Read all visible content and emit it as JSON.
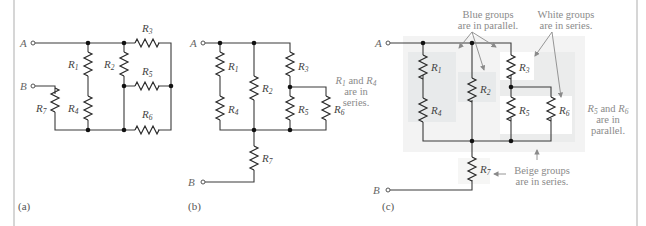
{
  "figure": {
    "panels": [
      {
        "id": "a",
        "caption": "(a)"
      },
      {
        "id": "b",
        "caption": "(b)"
      },
      {
        "id": "c",
        "caption": "(c)"
      }
    ],
    "terminals": {
      "A": "A",
      "B": "B"
    },
    "resistors": {
      "R1": {
        "base": "R",
        "sub": "1"
      },
      "R2": {
        "base": "R",
        "sub": "2"
      },
      "R3": {
        "base": "R",
        "sub": "3"
      },
      "R4": {
        "base": "R",
        "sub": "4"
      },
      "R5": {
        "base": "R",
        "sub": "5"
      },
      "R6": {
        "base": "R",
        "sub": "6"
      },
      "R7": {
        "base": "R",
        "sub": "7"
      }
    },
    "annotations": {
      "blue": {
        "line1": "Blue groups",
        "line2": "are in parallel."
      },
      "white": {
        "line1": "White groups",
        "line2": "are in series."
      },
      "r1r4": {
        "r1": "R",
        "r1sub": "1",
        "and": " and ",
        "r4": "R",
        "r4sub": "4",
        "line2": "are in",
        "line3": "series."
      },
      "r5r6": {
        "r5": "R",
        "r5sub": "5",
        "and": " and ",
        "r6": "R",
        "r6sub": "6",
        "line2": "are in",
        "line3": "parallel."
      },
      "beige": {
        "line1": "Beige groups",
        "line2": "are in series."
      }
    },
    "colors": {
      "blue_group": "#e9ebec",
      "beige_group": "#f1f1f0",
      "outer_region": "#f4f4f4",
      "white_group": "#ffffff",
      "wire": "#3a3a3a",
      "annotation_text": "#8a8a8a"
    }
  }
}
